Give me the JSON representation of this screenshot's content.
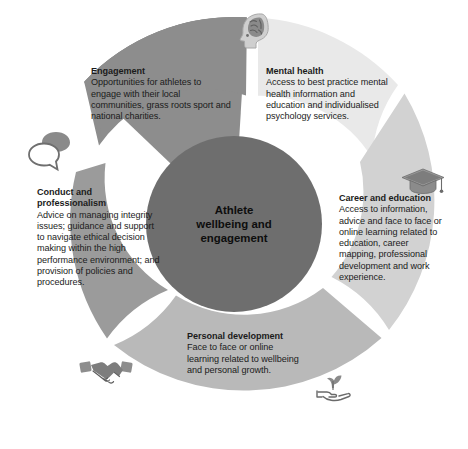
{
  "diagram": {
    "type": "donut-wheel",
    "hub": {
      "label": "Athlete wellbeing and engagement",
      "line1": "Athlete",
      "line2": "wellbeing and",
      "line3": "engagement",
      "color": "#6e6e6e"
    },
    "background_color": "#ffffff",
    "segments": [
      {
        "key": "engagement",
        "title": "Engagement",
        "body": "Opportunities for athletes to engage with their local communities, grass roots sport and national charities.",
        "color": "#8d8d8d",
        "icon": "speech-bubbles-icon"
      },
      {
        "key": "mental-health",
        "title": "Mental health",
        "body": "Access to best practice mental health information and education and individualised psychology services.",
        "color": "#e9e9e9",
        "icon": "brain-head-icon"
      },
      {
        "key": "career-and-education",
        "title": "Career and education",
        "body": "Access to information, advice and face to face or online learning related to education, career mapping, professional development and work experience.",
        "color": "#d2d2d2",
        "icon": "graduation-cap-icon"
      },
      {
        "key": "personal-development",
        "title": "Personal development",
        "body": "Face to face or online learning related to wellbeing and personal growth.",
        "color": "#b9b9b9",
        "icon": "hand-plant-icon"
      },
      {
        "key": "conduct-and-professionalism",
        "title": "Conduct and professionalism",
        "body": "Advice on managing integrity issues; guidance and support to navigate ethical decision making within the high performance environment; and provision of policies and procedures.",
        "color": "#9b9b9b",
        "icon": "handshake-icon"
      }
    ]
  }
}
